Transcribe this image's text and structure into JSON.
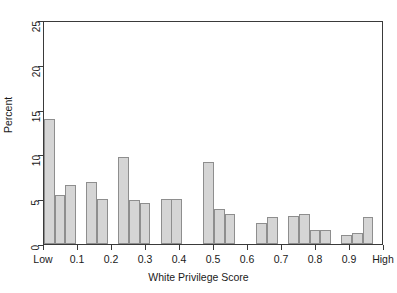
{
  "chart_data": {
    "type": "bar",
    "title": "",
    "subtitle": "",
    "xlabel": "White Privilege Score",
    "ylabel": "Percent",
    "xlim": [
      0,
      1
    ],
    "ylim": [
      0,
      25
    ],
    "grid": false,
    "legend": null,
    "bar_fill_color": "#d5d5d5",
    "bar_border_color": "#8e8e8e",
    "axis_color": "#3a3a3a",
    "background_color": "#ffffff",
    "x_tick_values": [
      0,
      0.1,
      0.2,
      0.3,
      0.4,
      0.5,
      0.6,
      0.7,
      0.8,
      0.9,
      1.0
    ],
    "x_tick_labels": [
      "Low",
      "0.1",
      "0.2",
      "0.3",
      "0.4",
      "0.5",
      "0.6",
      "0.7",
      "0.8",
      "0.9",
      "High"
    ],
    "y_tick_values": [
      0,
      5,
      10,
      15,
      20,
      25
    ],
    "y_tick_labels": [
      "0",
      "5",
      "10",
      "15",
      "20",
      "25"
    ],
    "bin_width": 0.03125,
    "bins": [
      {
        "x": 0.031,
        "value": 13.9
      },
      {
        "x": 0.063,
        "value": 5.5
      },
      {
        "x": 0.094,
        "value": 6.6
      },
      {
        "x": 0.156,
        "value": 6.9
      },
      {
        "x": 0.188,
        "value": 5.0
      },
      {
        "x": 0.25,
        "value": 9.7
      },
      {
        "x": 0.281,
        "value": 4.9
      },
      {
        "x": 0.313,
        "value": 4.6
      },
      {
        "x": 0.375,
        "value": 5.0
      },
      {
        "x": 0.406,
        "value": 5.0
      },
      {
        "x": 0.5,
        "value": 9.2
      },
      {
        "x": 0.531,
        "value": 3.9
      },
      {
        "x": 0.563,
        "value": 3.4
      },
      {
        "x": 0.656,
        "value": 2.4
      },
      {
        "x": 0.688,
        "value": 3.0
      },
      {
        "x": 0.75,
        "value": 3.1
      },
      {
        "x": 0.781,
        "value": 3.4
      },
      {
        "x": 0.813,
        "value": 1.6
      },
      {
        "x": 0.844,
        "value": 1.6
      },
      {
        "x": 0.906,
        "value": 1.0
      },
      {
        "x": 0.938,
        "value": 1.2
      },
      {
        "x": 0.969,
        "value": 3.0
      }
    ]
  }
}
